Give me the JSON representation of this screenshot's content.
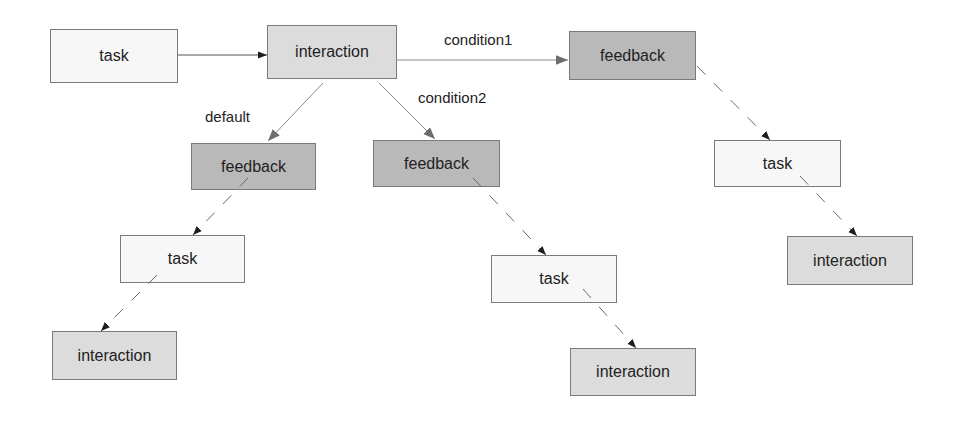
{
  "diagram": {
    "nodes": [
      {
        "id": "task-root",
        "type": "task",
        "label": "task",
        "x": 50,
        "y": 29,
        "w": 128,
        "h": 54
      },
      {
        "id": "interaction-root",
        "type": "interaction",
        "label": "interaction",
        "x": 267,
        "y": 25,
        "w": 130,
        "h": 54
      },
      {
        "id": "feedback-condition1",
        "type": "feedback",
        "label": "feedback",
        "x": 569,
        "y": 31,
        "w": 127,
        "h": 49
      },
      {
        "id": "feedback-default",
        "type": "feedback",
        "label": "feedback",
        "x": 191,
        "y": 143,
        "w": 125,
        "h": 47
      },
      {
        "id": "feedback-condition2",
        "type": "feedback",
        "label": "feedback",
        "x": 373,
        "y": 140,
        "w": 127,
        "h": 47
      },
      {
        "id": "task-condition1",
        "type": "task",
        "label": "task",
        "x": 714,
        "y": 140,
        "w": 127,
        "h": 47
      },
      {
        "id": "task-default",
        "type": "task",
        "label": "task",
        "x": 120,
        "y": 235,
        "w": 125,
        "h": 48
      },
      {
        "id": "task-condition2",
        "type": "task",
        "label": "task",
        "x": 491,
        "y": 255,
        "w": 126,
        "h": 48
      },
      {
        "id": "interaction-condition1",
        "type": "interaction",
        "label": "interaction",
        "x": 787,
        "y": 236,
        "w": 126,
        "h": 49
      },
      {
        "id": "interaction-default",
        "type": "interaction",
        "label": "interaction",
        "x": 52,
        "y": 331,
        "w": 125,
        "h": 49
      },
      {
        "id": "interaction-condition2",
        "type": "interaction",
        "label": "interaction",
        "x": 570,
        "y": 348,
        "w": 126,
        "h": 48
      }
    ],
    "edges": [
      {
        "from": "task-root",
        "to": "interaction-root",
        "style": "solid",
        "label": ""
      },
      {
        "from": "interaction-root",
        "to": "feedback-condition1",
        "style": "solid",
        "label": "condition1"
      },
      {
        "from": "interaction-root",
        "to": "feedback-default",
        "style": "solid",
        "label": "default"
      },
      {
        "from": "interaction-root",
        "to": "feedback-condition2",
        "style": "solid",
        "label": "condition2"
      },
      {
        "from": "feedback-condition1",
        "to": "task-condition1",
        "style": "dashed",
        "label": ""
      },
      {
        "from": "task-condition1",
        "to": "interaction-condition1",
        "style": "dashed",
        "label": ""
      },
      {
        "from": "feedback-default",
        "to": "task-default",
        "style": "dashed",
        "label": ""
      },
      {
        "from": "task-default",
        "to": "interaction-default",
        "style": "dashed",
        "label": ""
      },
      {
        "from": "feedback-condition2",
        "to": "task-condition2",
        "style": "dashed",
        "label": ""
      },
      {
        "from": "task-condition2",
        "to": "interaction-condition2",
        "style": "dashed",
        "label": ""
      }
    ],
    "edge_labels": {
      "condition1": {
        "text": "condition1",
        "x": 444,
        "y": 31
      },
      "condition2": {
        "text": "condition2",
        "x": 418,
        "y": 89
      },
      "default": {
        "text": "default",
        "x": 205,
        "y": 108
      }
    },
    "colors": {
      "task_fill": "#f7f7f7",
      "interaction_fill": "#dcdcdc",
      "feedback_fill": "#b9b9b9",
      "border": "#7a7a7a",
      "solid_edge": "#8a8a8a",
      "dashed_edge": "#6a6a6a",
      "dashed_arrowhead": "#1e1e1e"
    }
  }
}
